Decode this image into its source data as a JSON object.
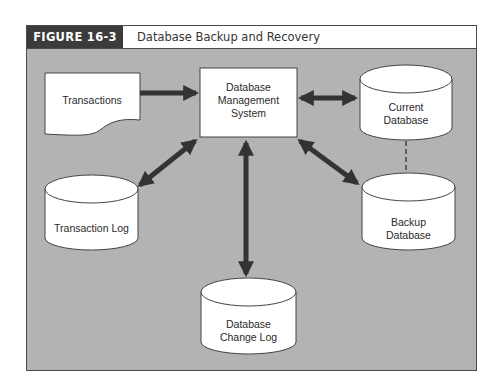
{
  "figure": {
    "label": "FIGURE 16-3",
    "title": "Database Backup and Recovery"
  },
  "colors": {
    "panel_background": "#b3b3b3",
    "header_label_background": "#3b3b3b",
    "arrow": "#333333",
    "shape_fill": "#ffffff"
  },
  "nodes": {
    "transactions": {
      "label": "Transactions",
      "shape": "document"
    },
    "dbms": {
      "line1": "Database",
      "line2": "Management",
      "line3": "System",
      "shape": "rectangle"
    },
    "current_db": {
      "line1": "Current",
      "line2": "Database",
      "shape": "cylinder"
    },
    "backup_db": {
      "line1": "Backup",
      "line2": "Database",
      "shape": "cylinder"
    },
    "transaction_log": {
      "label": "Transaction Log",
      "shape": "cylinder"
    },
    "change_log": {
      "line1": "Database",
      "line2": "Change Log",
      "shape": "cylinder"
    }
  },
  "edges": [
    {
      "from": "Transactions",
      "to": "Database Management System",
      "type": "single-arrow"
    },
    {
      "from": "Database Management System",
      "to": "Current Database",
      "type": "double-arrow"
    },
    {
      "from": "Database Management System",
      "to": "Transaction Log",
      "type": "double-arrow"
    },
    {
      "from": "Database Management System",
      "to": "Database Change Log",
      "type": "double-arrow"
    },
    {
      "from": "Database Management System",
      "to": "Backup Database",
      "type": "double-arrow"
    },
    {
      "from": "Current Database",
      "to": "Backup Database",
      "type": "dashed-line"
    }
  ]
}
